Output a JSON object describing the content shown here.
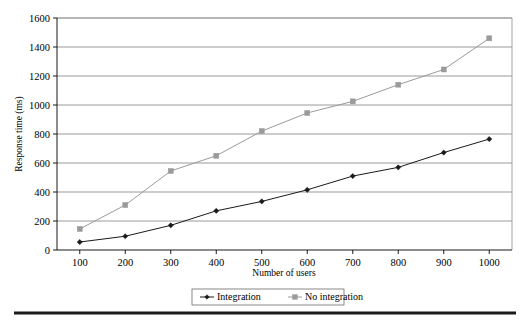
{
  "chart_data": {
    "type": "line",
    "title": "",
    "xlabel": "Number of users",
    "ylabel": "Response time (ms)",
    "x": [
      100,
      200,
      300,
      400,
      500,
      600,
      700,
      800,
      900,
      1000
    ],
    "categories": [
      "100",
      "200",
      "300",
      "400",
      "500",
      "600",
      "700",
      "800",
      "900",
      "1000"
    ],
    "xtick_labels": [
      "100",
      "200",
      "300",
      "400",
      "500",
      "600",
      "700",
      "800",
      "900",
      "1000"
    ],
    "ytick_labels": [
      "0",
      "200",
      "400",
      "600",
      "800",
      "1000",
      "1200",
      "1400",
      "1600"
    ],
    "yticks": [
      0,
      200,
      400,
      600,
      800,
      1000,
      1200,
      1400,
      1600
    ],
    "xlim": [
      50,
      1050
    ],
    "ylim": [
      0,
      1600
    ],
    "grid": "horizontal",
    "legend_position": "bottom",
    "series": [
      {
        "name": "Integration",
        "marker": "diamond",
        "color": "#1a1a1a",
        "values": [
          55,
          95,
          170,
          270,
          335,
          415,
          510,
          570,
          672,
          765
        ]
      },
      {
        "name": "No integration",
        "marker": "square",
        "color": "#9a9a9a",
        "values": [
          145,
          310,
          545,
          650,
          820,
          945,
          1025,
          1140,
          1245,
          1460
        ]
      }
    ]
  },
  "legend": {
    "items": [
      {
        "label": "Integration"
      },
      {
        "label": "No integration"
      }
    ]
  },
  "colors": {
    "integration": "#1a1a1a",
    "no_integration": "#9a9a9a",
    "grid": "#808080",
    "frame": "#9a9a9a",
    "rule": "#1a1a1a"
  }
}
